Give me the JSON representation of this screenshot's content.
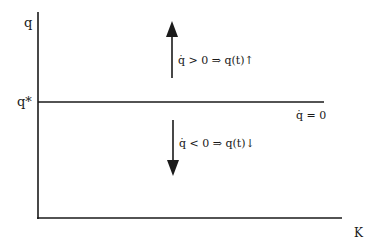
{
  "diagram": {
    "y_axis_label": "q",
    "x_axis_label": "K",
    "steady_state_label": "q*",
    "steady_state_line_label": "q̇ = 0",
    "upper_region_text": "q̇ > 0 ⇒ q(t)↑",
    "lower_region_text": "q̇ < 0 ⇒ q(t)↓",
    "line_color": "#1a1a1a"
  }
}
